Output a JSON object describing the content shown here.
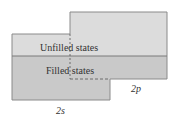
{
  "diagram": {
    "unfilled_label": "Unfilled states",
    "filled_label": "Filled states",
    "p_band_label": "2p",
    "s_band_label": "2s",
    "colors": {
      "unfilled_fill": "#dcdcdc",
      "filled_fill": "#c9c9c9",
      "stroke": "#8a8a8a",
      "text": "#333333"
    }
  }
}
